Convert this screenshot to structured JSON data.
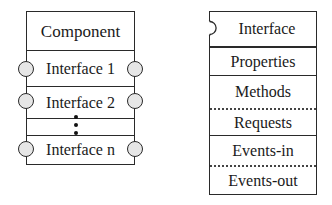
{
  "component_box": {
    "title": "Component",
    "interfaces": [
      {
        "label": "Interface 1"
      },
      {
        "label": "Interface 2"
      },
      {
        "label": "Interface n"
      }
    ],
    "ellipsis": "vertical-dots"
  },
  "interface_box": {
    "title": "Interface",
    "sections": [
      {
        "label": "Properties",
        "separator_above": "solid"
      },
      {
        "label": "Methods",
        "separator_above": "solid"
      },
      {
        "label": "Requests",
        "separator_above": "dotted"
      },
      {
        "label": "Events-in",
        "separator_above": "solid"
      },
      {
        "label": "Events-out",
        "separator_above": "dotted"
      }
    ]
  },
  "colors": {
    "line": "#2a2a2a",
    "port_fill": "#e6e6e6",
    "background": "#ffffff"
  }
}
